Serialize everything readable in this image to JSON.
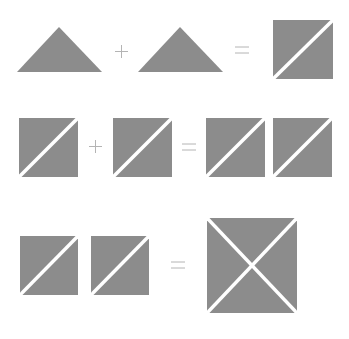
{
  "diagram": {
    "colors": {
      "fill": "#8c8c8c",
      "cut": "#ffffff",
      "operator": "#b4b4b4"
    },
    "rows": [
      {
        "equation": "triangle + triangle = half-square-pair",
        "operators": [
          "+",
          "="
        ]
      },
      {
        "equation": "half-square-pair + half-square-pair = two half-square-pairs",
        "operators": [
          "+",
          "="
        ]
      },
      {
        "equation": "two half-square-pairs = quarter-square (X-cut)",
        "operators": [
          "="
        ]
      }
    ]
  }
}
